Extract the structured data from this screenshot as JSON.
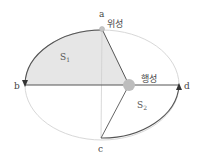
{
  "diagram": {
    "title": "",
    "points": [
      {
        "id": "a",
        "label": "a"
      },
      {
        "id": "b",
        "label": "b"
      },
      {
        "id": "c",
        "label": "c"
      },
      {
        "id": "d",
        "label": "d"
      }
    ],
    "satellite_label": "위성",
    "planet_label": "행성",
    "areas": [
      {
        "id": "S1",
        "symbol": "S",
        "subscript": "1"
      },
      {
        "id": "S2",
        "symbol": "S",
        "subscript": "2"
      }
    ],
    "colors": {
      "orbit": "#d8d8d8",
      "path": "#555555",
      "shaded_area": "#e6e6e6",
      "planet": "#bdbdbd",
      "satellite": "#c4c4c4",
      "axis": "#cfcfcf"
    }
  }
}
